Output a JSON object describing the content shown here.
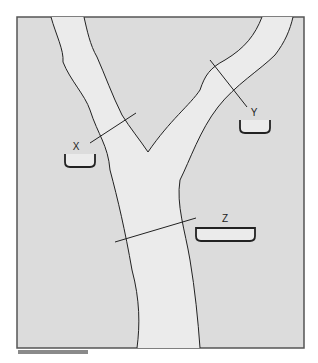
{
  "diagram": {
    "type": "river-channel-cross-sections",
    "colors": {
      "land": "#dcdcdc",
      "channel": "#ebebeb",
      "frame": "#555555",
      "line": "#222222",
      "scale_bar": "#8a8a8a"
    },
    "sections": [
      {
        "id": "X",
        "label": "X",
        "location": "left tributary",
        "cross_section_shape": "small deep trough"
      },
      {
        "id": "Y",
        "label": "Y",
        "location": "right tributary",
        "cross_section_shape": "small deep trough"
      },
      {
        "id": "Z",
        "label": "Z",
        "location": "main channel below confluence",
        "cross_section_shape": "wide trough"
      }
    ],
    "scale_bar": "present (unlabeled)"
  }
}
